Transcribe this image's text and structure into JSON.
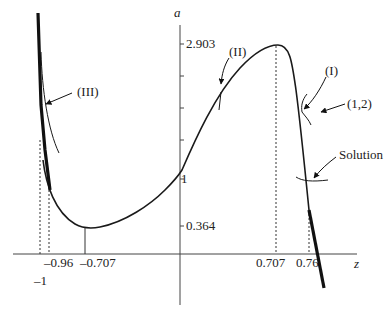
{
  "diagram": {
    "type": "function-plot-with-iteration-annotations",
    "axes": {
      "x_label": "z",
      "y_label": "a",
      "x_ticks": [
        "-1",
        "-0.96",
        "-0.707",
        "0.707",
        "0.76"
      ],
      "y_ticks": [
        "2.903",
        "1",
        "0.364"
      ]
    },
    "annotations": {
      "label_III": "(III)",
      "label_II": "(II)",
      "label_I": "(I)",
      "label_12": "(1,2)",
      "label_solution": "Solution"
    },
    "key_points": [
      {
        "name": "maximum",
        "z": 0.707,
        "a": 2.903
      },
      {
        "name": "minimum",
        "z": -0.707,
        "a": 0.364
      },
      {
        "name": "y-intercept",
        "z": 0,
        "a": 1
      },
      {
        "name": "solution",
        "z": 0.76,
        "a": 1
      },
      {
        "name": "left-branch-point",
        "z": -0.96
      }
    ],
    "colors": {
      "stroke": "#1a1a1a",
      "axis": "#444444"
    }
  }
}
